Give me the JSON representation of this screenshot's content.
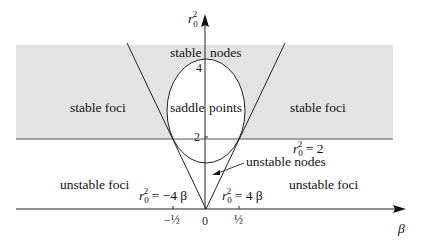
{
  "diagram": {
    "axes": {
      "x_label": "β",
      "y_label_base": "r",
      "y_label_sub": "0",
      "y_label_sup": "2",
      "x_ticks": [
        "−½",
        "0",
        "½"
      ],
      "y_ticks": [
        "2",
        "4"
      ]
    },
    "regions": {
      "stable_foci_left": "stable foci",
      "stable_foci_right": "stable foci",
      "stable_nodes_a": "stable",
      "stable_nodes_b": "nodes",
      "saddle_a": "saddle",
      "saddle_b": "points",
      "unstable_foci_left": "unstable foci",
      "unstable_foci_right": "unstable foci",
      "unstable_nodes": "unstable nodes"
    },
    "curves": {
      "left_line_eq_rhs": " = −4 β",
      "right_line_eq_rhs": " = 4 β",
      "hline_eq_rhs": " = 2"
    },
    "colors": {
      "shaded_region": "#e3e3e3",
      "lines": "#222222"
    }
  }
}
